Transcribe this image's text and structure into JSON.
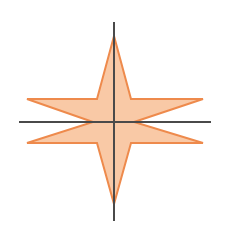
{
  "diagram": {
    "type": "four-pointed-star-on-axes",
    "colors": {
      "background": "#ffffff",
      "fill": "#F9C9A6",
      "stroke": "#EE8A4C",
      "axis": "#4a4a4a"
    },
    "axes": {
      "horizontal": {
        "x1": 19,
        "y1": 122,
        "x2": 211,
        "y2": 122
      },
      "vertical": {
        "x1": 114,
        "y1": 22,
        "x2": 114,
        "y2": 221
      }
    },
    "star": {
      "points": "114,36 131,99 203,99 134,122 203,143 131,143 114,204 97,143 27,143 93,122 27,99 97,99"
    }
  }
}
